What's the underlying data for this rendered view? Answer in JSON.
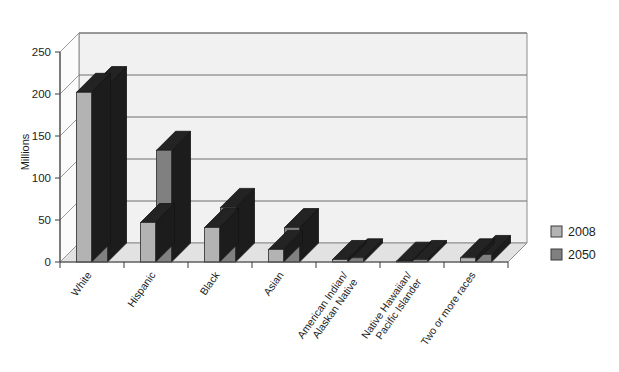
{
  "chart_data": {
    "type": "bar",
    "title": "",
    "subtitle": "",
    "xlabel": "",
    "ylabel": "Millions",
    "ylim": [
      0,
      250
    ],
    "ytick_step": 50,
    "yticks": [
      "0",
      "50",
      "100",
      "150",
      "200",
      "250"
    ],
    "grid": true,
    "three_d": true,
    "legend_position": "right",
    "categories": [
      "White",
      "Hispanic",
      "Black",
      "Asian",
      "American Indian/\nAlaskan Native",
      "Native Hawaiian/\nPacific Islander",
      "Two or more races"
    ],
    "category_lines": [
      [
        "White"
      ],
      [
        "Hispanic"
      ],
      [
        "Black"
      ],
      [
        "Asian"
      ],
      [
        "American Indian/",
        "Alaskan Native"
      ],
      [
        "Native Hawaiian/",
        "Pacific Islander"
      ],
      [
        "Two or more races"
      ]
    ],
    "series": [
      {
        "name": "2008",
        "color": "#b3b3b3",
        "values": [
          202,
          47,
          41,
          15,
          3,
          1,
          5
        ]
      },
      {
        "name": "2050",
        "color": "#808080",
        "values": [
          210,
          133,
          65,
          41,
          5,
          3,
          9
        ]
      }
    ]
  },
  "legend": {
    "items": [
      {
        "label": "2008",
        "color": "#b3b3b3"
      },
      {
        "label": "2050",
        "color": "#808080"
      }
    ]
  },
  "axes": {
    "y_title": "Millions",
    "y_ticks": [
      "250",
      "200",
      "150",
      "100",
      "50",
      "0"
    ]
  },
  "colors": {
    "series_2008_front": "#b3b3b3",
    "series_2008_top": "#1c1c1c",
    "series_2008_side": "#1c1c1c",
    "series_2050_front": "#808080",
    "series_2050_top": "#1c1c1c",
    "series_2050_side": "#1c1c1c",
    "plot_background": "#f1f1f1",
    "floor": "#e2e2e2",
    "gridline": "#6e6e6e",
    "text": "#1d1d1d"
  }
}
